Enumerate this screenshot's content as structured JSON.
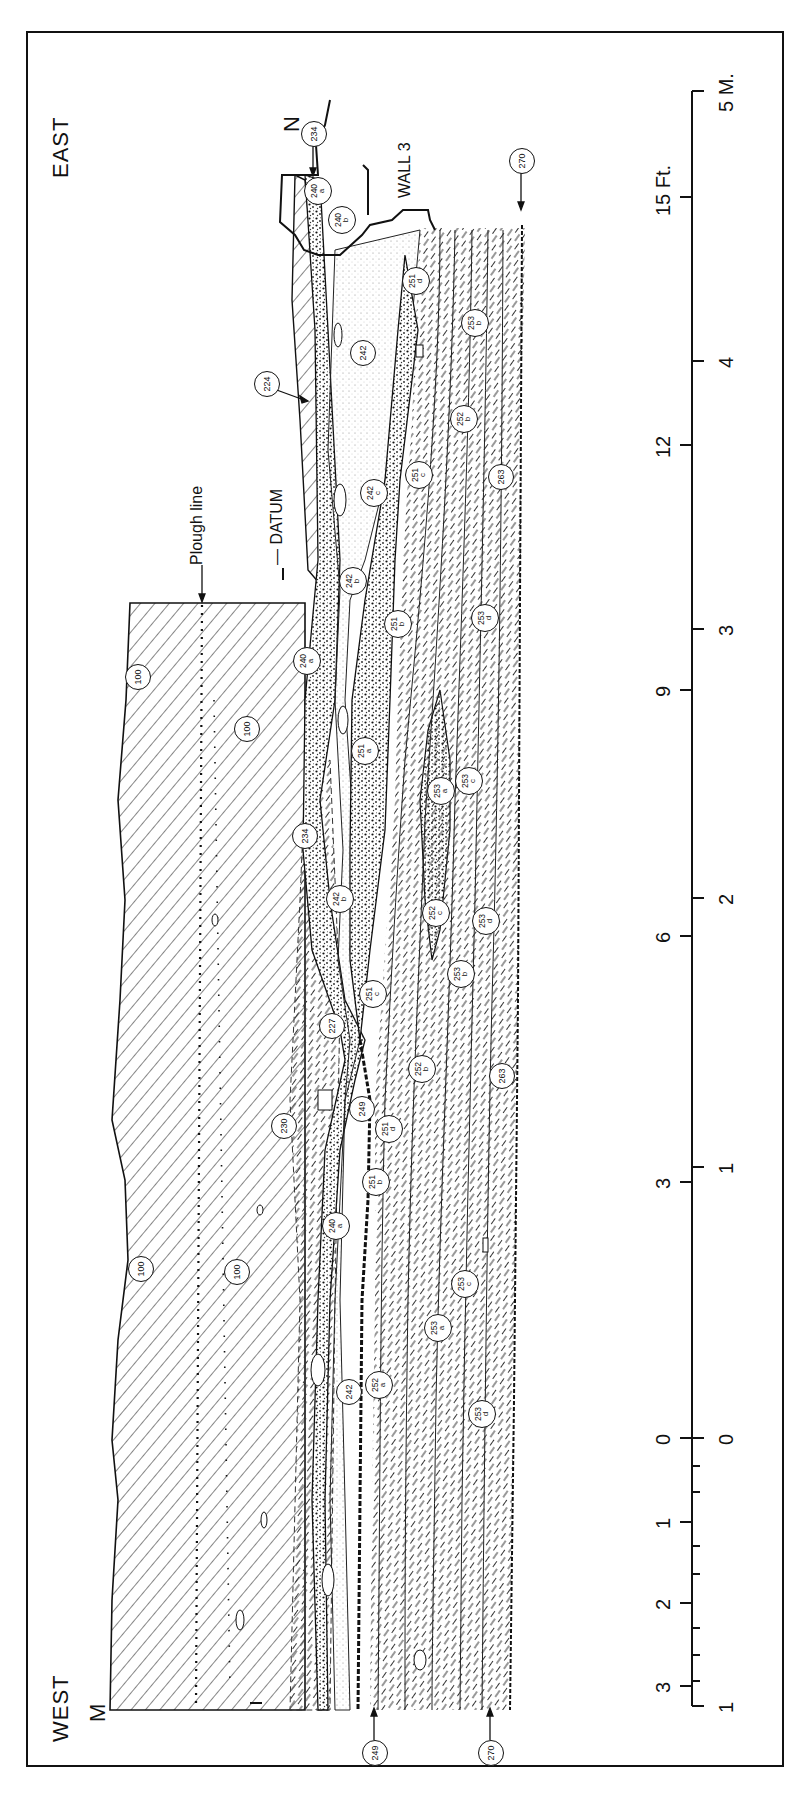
{
  "figure": {
    "orientation_labels": {
      "east": "EAST",
      "west": "WEST",
      "west_sub": "M",
      "north_marker": "N"
    },
    "annotations": {
      "plough_line": "Plough line",
      "datum": "— DATUM",
      "wall": "WALL 3"
    },
    "scale_bar": {
      "feet_unit": "Ft.",
      "meters_unit": "M.",
      "feet_ticks": [
        {
          "label": "15 Ft.",
          "y": 197
        },
        {
          "label": "12",
          "y": 445
        },
        {
          "label": "9",
          "y": 690
        },
        {
          "label": "6",
          "y": 936
        },
        {
          "label": "3",
          "y": 1182
        },
        {
          "label": "0",
          "y": 1438
        },
        {
          "label": "1",
          "y": 1522
        },
        {
          "label": "2",
          "y": 1603
        },
        {
          "label": "3",
          "y": 1686
        }
      ],
      "meter_ticks": [
        {
          "label": "5 M.",
          "y": 91
        },
        {
          "label": "4",
          "y": 361
        },
        {
          "label": "3",
          "y": 629
        },
        {
          "label": "2",
          "y": 898
        },
        {
          "label": "1",
          "y": 1167
        },
        {
          "label": "0",
          "y": 1438
        },
        {
          "label": "1",
          "y": 1706
        }
      ]
    },
    "context_labels": [
      {
        "num": "234",
        "sub": "",
        "x": 313,
        "y": 133
      },
      {
        "num": "240",
        "sub": "a",
        "x": 317,
        "y": 190
      },
      {
        "num": "240",
        "sub": "b",
        "x": 341,
        "y": 219
      },
      {
        "num": "270",
        "sub": "",
        "x": 521,
        "y": 160
      },
      {
        "num": "224",
        "sub": "",
        "x": 266,
        "y": 383
      },
      {
        "num": "242",
        "sub": "",
        "x": 362,
        "y": 352
      },
      {
        "num": "251",
        "sub": "d",
        "x": 415,
        "y": 280
      },
      {
        "num": "253",
        "sub": "b",
        "x": 474,
        "y": 322
      },
      {
        "num": "252",
        "sub": "b",
        "x": 463,
        "y": 418
      },
      {
        "num": "251",
        "sub": "c",
        "x": 418,
        "y": 474
      },
      {
        "num": "263",
        "sub": "",
        "x": 500,
        "y": 476
      },
      {
        "num": "242",
        "sub": "c",
        "x": 373,
        "y": 492
      },
      {
        "num": "242",
        "sub": "b",
        "x": 352,
        "y": 580
      },
      {
        "num": "251",
        "sub": "b",
        "x": 397,
        "y": 623
      },
      {
        "num": "253",
        "sub": "d",
        "x": 484,
        "y": 617
      },
      {
        "num": "240",
        "sub": "a",
        "x": 306,
        "y": 660
      },
      {
        "num": "100",
        "sub": "",
        "x": 137,
        "y": 676
      },
      {
        "num": "100",
        "sub": "",
        "x": 246,
        "y": 728
      },
      {
        "num": "251",
        "sub": "a",
        "x": 364,
        "y": 750
      },
      {
        "num": "253",
        "sub": "a",
        "x": 440,
        "y": 790
      },
      {
        "num": "253",
        "sub": "c",
        "x": 468,
        "y": 780
      },
      {
        "num": "234",
        "sub": "",
        "x": 304,
        "y": 835
      },
      {
        "num": "242",
        "sub": "b",
        "x": 339,
        "y": 898
      },
      {
        "num": "252",
        "sub": "c",
        "x": 435,
        "y": 912
      },
      {
        "num": "253",
        "sub": "d",
        "x": 485,
        "y": 920
      },
      {
        "num": "251",
        "sub": "c",
        "x": 372,
        "y": 993
      },
      {
        "num": "253",
        "sub": "b",
        "x": 460,
        "y": 973
      },
      {
        "num": "227",
        "sub": "",
        "x": 331,
        "y": 1025
      },
      {
        "num": "252",
        "sub": "b",
        "x": 421,
        "y": 1068
      },
      {
        "num": "263",
        "sub": "",
        "x": 501,
        "y": 1075
      },
      {
        "num": "230",
        "sub": "",
        "x": 283,
        "y": 1125
      },
      {
        "num": "249",
        "sub": "",
        "x": 361,
        "y": 1108
      },
      {
        "num": "251",
        "sub": "d",
        "x": 388,
        "y": 1128
      },
      {
        "num": "251",
        "sub": "b",
        "x": 375,
        "y": 1181
      },
      {
        "num": "240",
        "sub": "a",
        "x": 335,
        "y": 1225
      },
      {
        "num": "100",
        "sub": "",
        "x": 140,
        "y": 1268
      },
      {
        "num": "100",
        "sub": "",
        "x": 236,
        "y": 1271
      },
      {
        "num": "253",
        "sub": "c",
        "x": 464,
        "y": 1283
      },
      {
        "num": "253",
        "sub": "a",
        "x": 437,
        "y": 1327
      },
      {
        "num": "242",
        "sub": "",
        "x": 348,
        "y": 1391
      },
      {
        "num": "252",
        "sub": "a",
        "x": 378,
        "y": 1384
      },
      {
        "num": "253",
        "sub": "d",
        "x": 481,
        "y": 1413
      },
      {
        "num": "249",
        "sub": "",
        "x": 374,
        "y": 1752
      },
      {
        "num": "270",
        "sub": "",
        "x": 490,
        "y": 1752
      }
    ],
    "colors": {
      "ink": "#111111",
      "paper": "#ffffff"
    }
  }
}
